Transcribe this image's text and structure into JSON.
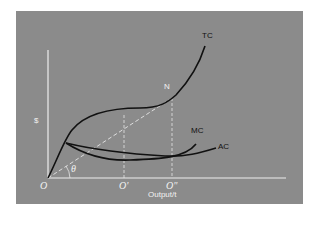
{
  "figure": {
    "background_color": "#8b8b8b",
    "axis_color": "#eeeeee",
    "curve_color": "#111111",
    "y_axis_label": "$",
    "x_axis_label": "Output/t",
    "origin_label": "O",
    "x_ticks": [
      "O'",
      "O\""
    ],
    "angle_label": "θ",
    "point_label": "N",
    "curves": [
      {
        "name": "TC",
        "label": "TC"
      },
      {
        "name": "MC",
        "label": "MC"
      },
      {
        "name": "AC",
        "label": "AC"
      }
    ]
  }
}
